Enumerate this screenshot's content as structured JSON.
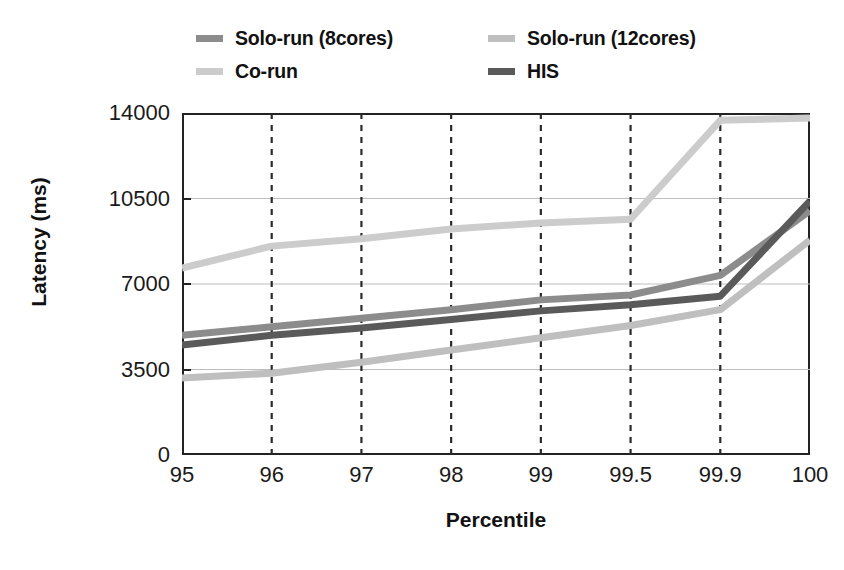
{
  "chart_data": {
    "type": "line",
    "title": "",
    "xlabel": "Percentile",
    "ylabel": "Latency (ms)",
    "categories": [
      "95",
      "96",
      "97",
      "98",
      "99",
      "99.5",
      "99.9",
      "100"
    ],
    "ylim": [
      0,
      14000
    ],
    "yticks": [
      0,
      3500,
      7000,
      10500,
      14000
    ],
    "ytick_labels": [
      "0",
      "3500",
      "7000",
      "10500",
      "14000"
    ],
    "grid": "horizontal-solid-and-vertical-dashed",
    "legend_position": "top",
    "series": [
      {
        "name": "Solo-run (8cores)",
        "color": "#8c8c8c",
        "values": [
          4900,
          5250,
          5600,
          5950,
          6350,
          6550,
          7350,
          10000
        ]
      },
      {
        "name": "Solo-run (12cores)",
        "color": "#bfbfbf",
        "values": [
          3150,
          3350,
          3800,
          4300,
          4800,
          5300,
          5950,
          8800
        ]
      },
      {
        "name": "Co-run",
        "color": "#cccccc",
        "values": [
          7650,
          8550,
          8850,
          9250,
          9500,
          9650,
          13700,
          13800
        ]
      },
      {
        "name": "HIS",
        "color": "#5a5a5a",
        "values": [
          4500,
          4900,
          5200,
          5550,
          5900,
          6150,
          6500,
          10400
        ]
      }
    ]
  },
  "legend": {
    "entries": [
      {
        "label": "Solo-run (8cores)",
        "color": "#8c8c8c"
      },
      {
        "label": "Solo-run (12cores)",
        "color": "#bfbfbf"
      },
      {
        "label": "Co-run",
        "color": "#cccccc"
      },
      {
        "label": "HIS",
        "color": "#5a5a5a"
      }
    ]
  }
}
